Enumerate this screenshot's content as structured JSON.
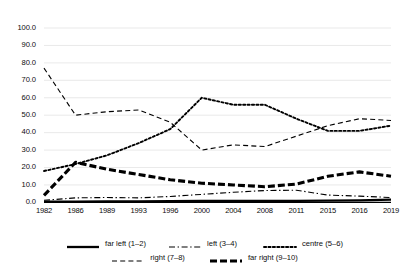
{
  "chart_data": {
    "type": "line",
    "title": "",
    "xlabel": "",
    "ylabel": "",
    "ylim": [
      0,
      100
    ],
    "ytick_step": 10,
    "grid": true,
    "legend_position": "bottom",
    "categories": [
      "1982",
      "1986",
      "1989",
      "1993",
      "1996",
      "2000",
      "2004",
      "2008",
      "2011",
      "2015",
      "2016",
      "2019"
    ],
    "ytick_labels": [
      "100.0",
      "90.0",
      "80.0",
      "70.0",
      "60.0",
      "50.0",
      "40.0",
      "30.0",
      "20.0",
      "10.0",
      "0.0"
    ],
    "series": [
      {
        "name": "far left (1–2)",
        "style": "solid",
        "values": [
          0.4,
          0.5,
          0.6,
          0.6,
          0.7,
          0.8,
          0.8,
          0.9,
          0.9,
          1.0,
          1.2,
          1.6
        ]
      },
      {
        "name": "left (3–4)",
        "style": "dash-dot",
        "values": [
          1.2,
          2.6,
          2.8,
          2.6,
          3.4,
          4.6,
          5.8,
          6.8,
          7.0,
          4.2,
          3.6,
          2.8
        ]
      },
      {
        "name": "centre (5–6)",
        "style": "dotted",
        "values": [
          18.0,
          22.0,
          27.0,
          34.0,
          42.0,
          60.0,
          56.0,
          56.0,
          48.0,
          41.0,
          41.0,
          44.0
        ]
      },
      {
        "name": "right (7–8)",
        "style": "dashed",
        "values": [
          77.0,
          50.0,
          52.0,
          53.0,
          46.0,
          30.0,
          33.0,
          32.0,
          38.0,
          44.0,
          48.0,
          47.0
        ]
      },
      {
        "name": "far right (9–10)",
        "style": "thick-dashed",
        "values": [
          4.0,
          23.0,
          19.0,
          16.0,
          13.0,
          11.0,
          10.0,
          9.0,
          10.5,
          15.0,
          17.5,
          15.0
        ]
      }
    ]
  }
}
